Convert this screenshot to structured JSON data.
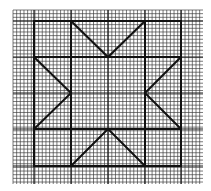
{
  "diagram": {
    "title": "",
    "type": "quilt-block-pattern",
    "canvas": {
      "width": 211,
      "height": 191,
      "background": "#ffffff"
    },
    "graph_paper": {
      "x_start": 13,
      "x_end": 203,
      "y_start": 10,
      "y_end": 184,
      "fine_spacing": 3.66,
      "fine_color": "#3a3a3a",
      "medium_x": [
        34,
        71,
        108,
        145,
        181
      ],
      "medium_y": [
        21,
        57,
        93,
        129,
        166
      ],
      "medium_color": "#1a1a1a"
    },
    "block": {
      "outer_square": {
        "x1": 34,
        "y1": 21,
        "x2": 181,
        "y2": 166
      },
      "inner_verticals": [
        71,
        145
      ],
      "inner_horizontals": [
        57,
        129
      ],
      "center_square": {
        "x1": 71,
        "y1": 57,
        "x2": 145,
        "y2": 129
      },
      "stroke_color": "#111111",
      "stroke_width": 2
    },
    "star_points": [
      {
        "name": "top",
        "points": [
          [
            71,
            21
          ],
          [
            108,
            57
          ],
          [
            145,
            21
          ]
        ]
      },
      {
        "name": "bottom",
        "points": [
          [
            71,
            166
          ],
          [
            108,
            129
          ],
          [
            145,
            166
          ]
        ]
      },
      {
        "name": "left",
        "points": [
          [
            34,
            57
          ],
          [
            71,
            93
          ],
          [
            34,
            129
          ]
        ]
      },
      {
        "name": "right",
        "points": [
          [
            181,
            57
          ],
          [
            145,
            93
          ],
          [
            181,
            129
          ]
        ]
      }
    ]
  }
}
